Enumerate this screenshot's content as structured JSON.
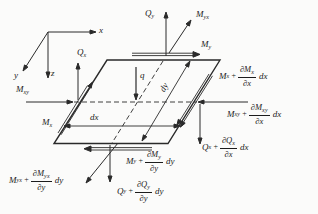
{
  "axes": {
    "x": "x",
    "y": "y",
    "z": "z"
  },
  "loads": {
    "q": "q",
    "Qx": {
      "base": "Q",
      "sub": "x"
    },
    "Qy": {
      "base": "Q",
      "sub": "y"
    },
    "My": {
      "base": "M",
      "sub": "y"
    },
    "Myx": {
      "base": "M",
      "sub": "yx"
    },
    "Mxy": {
      "base": "M",
      "sub": "xy"
    },
    "Mx": {
      "base": "M",
      "sub": "x"
    }
  },
  "dims": {
    "dx": "dx",
    "dy": "dy"
  },
  "increments": {
    "Mx": {
      "base": "M",
      "sub": "x",
      "plus": "+",
      "num_base": "∂M",
      "num_sub": "x",
      "den": "∂x",
      "diff": "dx"
    },
    "Mxy": {
      "base": "M",
      "sub": "xy",
      "plus": "+",
      "num_base": "∂M",
      "num_sub": "xy",
      "den": "∂x",
      "diff": "dx"
    },
    "Qx": {
      "base": "Q",
      "sub": "x",
      "plus": "+",
      "num_base": "∂Q",
      "num_sub": "x",
      "den": "∂x",
      "diff": "dx"
    },
    "My": {
      "base": "M",
      "sub": "y",
      "plus": "+",
      "num_base": "∂M",
      "num_sub": "y",
      "den": "∂y",
      "diff": "dy"
    },
    "Qy": {
      "base": "Q",
      "sub": "y",
      "plus": "+",
      "num_base": "∂Q",
      "num_sub": "y",
      "den": "∂y",
      "diff": "dy"
    },
    "Myx": {
      "base": "M",
      "sub": "yx",
      "plus": "+",
      "num_base": "∂M",
      "num_sub": "yx",
      "den": "∂y",
      "diff": "dy"
    }
  }
}
